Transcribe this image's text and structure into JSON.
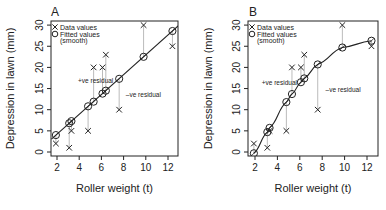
{
  "chart_data": [
    {
      "panel": "A",
      "type": "scatter",
      "title": "A",
      "xlabel": "Roller weight (t)",
      "ylabel": "Depression in lawn (mm)",
      "xlim": [
        1.5,
        13
      ],
      "ylim": [
        -1,
        31
      ],
      "xticks": [
        2,
        4,
        6,
        8,
        10,
        12
      ],
      "yticks": [
        0,
        5,
        10,
        15,
        20,
        25,
        30
      ],
      "grid": false,
      "legend": {
        "position": "top-left",
        "entries": [
          "Data values",
          "Fitted values (smooth)"
        ]
      },
      "fit_type": "line",
      "x": [
        1.9,
        3.1,
        3.3,
        4.8,
        5.3,
        6.1,
        6.4,
        7.6,
        9.8,
        12.4
      ],
      "series": [
        {
          "name": "Data values",
          "marker": "x",
          "values": [
            2,
            1,
            5,
            5,
            20,
            20,
            23,
            10,
            30,
            25
          ]
        },
        {
          "name": "Fitted values (smooth)",
          "marker": "o",
          "values": [
            4.0,
            6.8,
            7.3,
            10.8,
            11.9,
            13.8,
            14.5,
            17.3,
            22.5,
            28.6
          ]
        }
      ],
      "annotations": [
        {
          "text": "+ve residual",
          "x": 3.9,
          "y": 16.2
        },
        {
          "text": "–ve residual",
          "x": 8.2,
          "y": 13.0
        }
      ]
    },
    {
      "panel": "B",
      "type": "scatter",
      "title": "B",
      "xlabel": "Roller weight (t)",
      "ylabel": "Depression in lawn (mm)",
      "xlim": [
        1.5,
        13
      ],
      "ylim": [
        -1,
        31
      ],
      "xticks": [
        2,
        4,
        6,
        8,
        10,
        12
      ],
      "yticks": [
        0,
        5,
        10,
        15,
        20,
        25,
        30
      ],
      "grid": false,
      "legend": {
        "position": "top-left",
        "entries": [
          "Data values",
          "Fitted values (smooth)"
        ]
      },
      "fit_type": "smooth curve",
      "x": [
        1.9,
        3.1,
        3.3,
        4.8,
        5.3,
        6.1,
        6.4,
        7.6,
        9.8,
        12.4
      ],
      "series": [
        {
          "name": "Data values",
          "marker": "x",
          "values": [
            2,
            1,
            5,
            5,
            20,
            20,
            23,
            10,
            30,
            25
          ]
        },
        {
          "name": "Fitted values (smooth)",
          "marker": "o",
          "values": [
            -0.3,
            4.7,
            5.7,
            11.8,
            13.7,
            16.5,
            17.4,
            20.7,
            24.7,
            26.3
          ]
        }
      ],
      "annotations": [
        {
          "text": "+ve residual",
          "x": 2.6,
          "y": 15.8
        },
        {
          "text": "–ve residual",
          "x": 8.3,
          "y": 14.1
        }
      ]
    }
  ],
  "panels": {
    "a": {
      "letter": "A"
    },
    "b": {
      "letter": "B"
    }
  },
  "labels": {
    "xlabel": "Roller weight (t)",
    "ylabel": "Depression in lawn (mm)",
    "legend_data": "Data values",
    "legend_fitted_1": "Fitted values",
    "legend_fitted_2": "(smooth)",
    "pos_residual": "+ve residual",
    "neg_residual": "–ve residual"
  }
}
